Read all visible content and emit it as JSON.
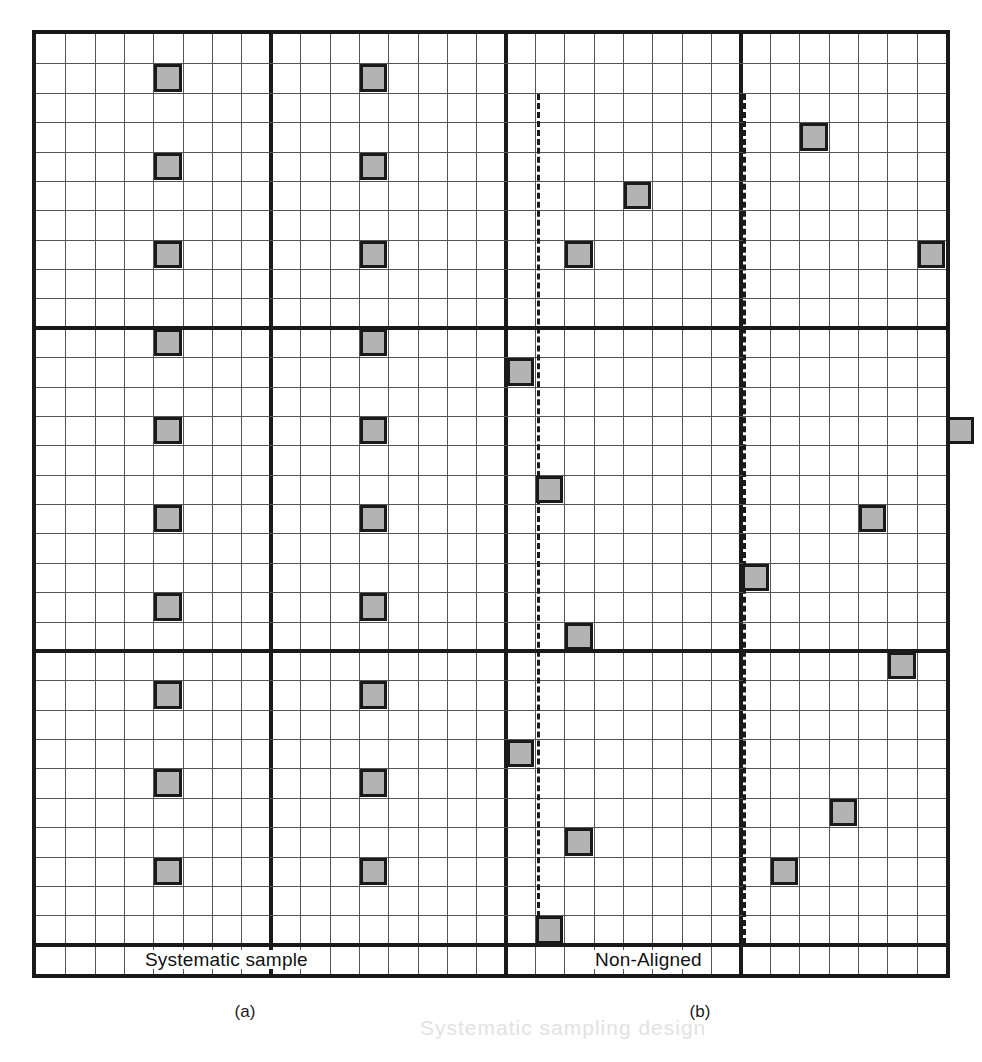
{
  "figure": {
    "panel_a": {
      "inline_label": "Systematic sample",
      "caption": "(a)"
    },
    "panel_b": {
      "inline_label": "Non-Aligned",
      "caption": "(b)"
    },
    "ghost_text": "Systematic sampling design"
  },
  "colors": {
    "square_fill": "#b3b3b3",
    "square_border": "#1a1a1a",
    "major_line": "#1a1a1a",
    "minor_line": "#555555",
    "background": "#ffffff"
  },
  "chart_data": {
    "type": "scatter",
    "xlabel": "",
    "ylabel": "",
    "grid": true,
    "legend": "none",
    "grid_spec": {
      "cols": 31,
      "rows": 32,
      "cell_px": 29.3,
      "major_cols": [
        8,
        16,
        24
      ],
      "major_rows": [
        10,
        21,
        31
      ],
      "note": "Thick lines partition the area into strata / blocks; thin lines are individual quadrats."
    },
    "panels": [
      {
        "name": "Systematic sample",
        "caption": "(a)",
        "col_range": [
          0,
          15
        ],
        "points": [
          {
            "col": 4,
            "row": 1
          },
          {
            "col": 11,
            "row": 1
          },
          {
            "col": 4,
            "row": 4
          },
          {
            "col": 11,
            "row": 4
          },
          {
            "col": 4,
            "row": 7
          },
          {
            "col": 11,
            "row": 7
          },
          {
            "col": 4,
            "row": 10
          },
          {
            "col": 11,
            "row": 10
          },
          {
            "col": 4,
            "row": 13
          },
          {
            "col": 11,
            "row": 13
          },
          {
            "col": 4,
            "row": 16
          },
          {
            "col": 11,
            "row": 16
          },
          {
            "col": 4,
            "row": 19
          },
          {
            "col": 11,
            "row": 19
          },
          {
            "col": 4,
            "row": 22
          },
          {
            "col": 11,
            "row": 22
          },
          {
            "col": 4,
            "row": 25
          },
          {
            "col": 11,
            "row": 25
          },
          {
            "col": 4,
            "row": 28
          },
          {
            "col": 11,
            "row": 28
          }
        ]
      },
      {
        "name": "Non-Aligned",
        "caption": "(b)",
        "col_range": [
          16,
          31
        ],
        "dashed_guide_cols": [
          17,
          24
        ],
        "points": [
          {
            "col": 26,
            "row": 3
          },
          {
            "col": 20,
            "row": 5
          },
          {
            "col": 18,
            "row": 7
          },
          {
            "col": 30,
            "row": 7
          },
          {
            "col": 16,
            "row": 11
          },
          {
            "col": 31,
            "row": 13
          },
          {
            "col": 28,
            "row": 16
          },
          {
            "col": 17,
            "row": 15
          },
          {
            "col": 24,
            "row": 18
          },
          {
            "col": 18,
            "row": 20
          },
          {
            "col": 29,
            "row": 21
          },
          {
            "col": 16,
            "row": 24
          },
          {
            "col": 27,
            "row": 26
          },
          {
            "col": 18,
            "row": 27
          },
          {
            "col": 25,
            "row": 28
          },
          {
            "col": 17,
            "row": 30
          }
        ]
      }
    ]
  }
}
